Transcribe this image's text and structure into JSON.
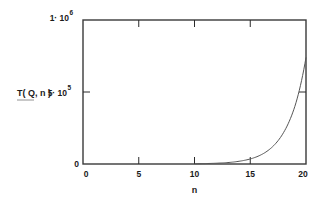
{
  "chart_data": {
    "type": "line",
    "title": "",
    "xlabel": "n",
    "ylabel": "T( Q, n )",
    "xlim": [
      0,
      20
    ],
    "ylim": [
      0,
      1000000
    ],
    "grid": false,
    "legend": null,
    "x_ticks": [
      {
        "value": 0,
        "label": "0"
      },
      {
        "value": 5,
        "label": "5"
      },
      {
        "value": 10,
        "label": "10"
      },
      {
        "value": 15,
        "label": "15"
      },
      {
        "value": 20,
        "label": "20"
      }
    ],
    "y_ticks": [
      {
        "value": 0,
        "label": "0",
        "mantissa": "",
        "exp": ""
      },
      {
        "value": 500000,
        "label": "5·10^5",
        "mantissa": "5· 10",
        "exp": "5"
      },
      {
        "value": 1000000,
        "label": "1·10^6",
        "mantissa": "1· 10",
        "exp": "6"
      }
    ],
    "series": [
      {
        "name": "T(Q, n)",
        "color": "#555555",
        "x": [
          10,
          11,
          12,
          13,
          14,
          15,
          16,
          17,
          18,
          19,
          20
        ],
        "y": [
          1600,
          3000,
          5600,
          10000,
          19000,
          35000,
          65000,
          120000,
          220000,
          400000,
          740000
        ]
      }
    ]
  },
  "labels": {
    "xlabel": "n",
    "ylabel": "T( Q, n )",
    "y0": "0",
    "y_mid_mantissa": "5· 10",
    "y_mid_exp": "5",
    "y_top_mantissa": "1· 10",
    "y_top_exp": "6",
    "x0": "0",
    "x5": "5",
    "x10": "10",
    "x15": "15",
    "x20": "20"
  }
}
